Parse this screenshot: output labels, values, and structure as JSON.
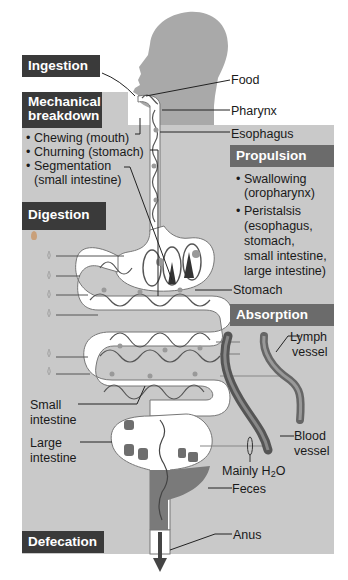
{
  "diagram": {
    "type": "digestive-process-overview",
    "colors": {
      "panel_gray": "#c9c9c9",
      "head_silhouette": "#a9a9a9",
      "dark_box": "#3a3a3a",
      "mid_box": "#6b6b6b",
      "tract_fill": "#ffffff",
      "feces": "#7a7a7a",
      "vessel": "#5a5a5a"
    },
    "process_boxes": {
      "ingestion": "Ingestion",
      "mechanical_breakdown_line1": "Mechanical",
      "mechanical_breakdown_line2": "breakdown",
      "propulsion": "Propulsion",
      "digestion": "Digestion",
      "absorption": "Absorption",
      "defecation": "Defecation"
    },
    "mechanical_breakdown_items": [
      {
        "line1": "Chewing (mouth)"
      },
      {
        "line1": "Churning (stomach)"
      },
      {
        "line1": "Segmentation",
        "line2": "(small intestine)"
      }
    ],
    "propulsion_items": [
      {
        "line1": "Swallowing",
        "line2": "(oropharynx)"
      },
      {
        "line1": "Peristalsis",
        "line2": "(esophagus,",
        "line3": "stomach,",
        "line4": "small intestine,",
        "line5": "large intestine)"
      }
    ],
    "anatomy_labels": {
      "food": "Food",
      "pharynx": "Pharynx",
      "esophagus": "Esophagus",
      "stomach": "Stomach",
      "lymph_vessel_line1": "Lymph",
      "lymph_vessel_line2": "vessel",
      "small_intestine_line1": "Small",
      "small_intestine_line2": "intestine",
      "large_intestine_line1": "Large",
      "large_intestine_line2": "intestine",
      "blood_vessel_line1": "Blood",
      "blood_vessel_line2": "vessel",
      "mainly_h2o_prefix": "Mainly H",
      "mainly_h2o_sub": "2",
      "mainly_h2o_suffix": "O",
      "feces": "Feces",
      "anus": "Anus"
    },
    "digestion_enzyme_drops": 6
  }
}
